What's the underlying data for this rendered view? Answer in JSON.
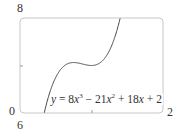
{
  "chart_data": {
    "type": "line",
    "title": "",
    "xlabel": "",
    "ylabel": "",
    "xlim": [
      0,
      2
    ],
    "ylim": [
      6,
      8
    ],
    "x_tick_labels": [
      "0",
      "2"
    ],
    "y_tick_labels": [
      "6",
      "8"
    ],
    "grid": false,
    "series": [
      {
        "name": "y = 8x^3 - 21x^2 + 18x + 2",
        "function": "8x^3 - 21x^2 + 18x + 2",
        "x": [
          0.34,
          0.4,
          0.5,
          0.6,
          0.7,
          0.75,
          0.8,
          0.9,
          1.0,
          1.1,
          1.2,
          1.3,
          1.4
        ],
        "y": [
          6.0,
          6.35,
          6.75,
          6.97,
          7.06,
          7.06,
          7.06,
          7.03,
          7.0,
          7.02,
          7.14,
          7.45,
          8.0
        ]
      }
    ],
    "annotations": [
      "y = 8x³ − 21x² + 18x + 2"
    ]
  },
  "labels": {
    "y_top": "8",
    "y_bottom": "6",
    "x_left": "0",
    "x_right": "2"
  },
  "equation": {
    "lhs": "y",
    "eq": " = 8",
    "x1": "x",
    "p1": "3",
    "t2": " − 21",
    "x2": "x",
    "p2": "2",
    "t3": " + 18",
    "x3": "x",
    "t4": " + 2"
  }
}
